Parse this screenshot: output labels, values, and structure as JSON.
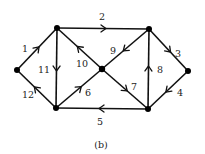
{
  "caption": "(b)",
  "colors": {
    "stroke": "#111111",
    "node": "#000000",
    "text": "#222222",
    "background": "#ffffff"
  },
  "nodes": [
    {
      "id": "L",
      "x": 17,
      "y": 70
    },
    {
      "id": "TL",
      "x": 57,
      "y": 28
    },
    {
      "id": "TR",
      "x": 149,
      "y": 29
    },
    {
      "id": "R",
      "x": 188,
      "y": 71
    },
    {
      "id": "BR",
      "x": 148,
      "y": 109
    },
    {
      "id": "BL",
      "x": 56,
      "y": 108
    },
    {
      "id": "C",
      "x": 102,
      "y": 69
    }
  ],
  "edges": [
    {
      "label": "1",
      "from": "L",
      "to": "TL",
      "label_x": 25,
      "label_y": 52
    },
    {
      "label": "2",
      "from": "TL",
      "to": "TR",
      "label_x": 102,
      "label_y": 20
    },
    {
      "label": "3",
      "from": "TR",
      "to": "R",
      "label_x": 178,
      "label_y": 57
    },
    {
      "label": "4",
      "from": "R",
      "to": "BR",
      "label_x": 180,
      "label_y": 96
    },
    {
      "label": "5",
      "from": "BR",
      "to": "BL",
      "label_x": 100,
      "label_y": 125
    },
    {
      "label": "6",
      "from": "BL",
      "to": "C",
      "label_x": 88,
      "label_y": 96
    },
    {
      "label": "7",
      "from": "C",
      "to": "BR",
      "label_x": 134,
      "label_y": 90
    },
    {
      "label": "8",
      "from": "BR",
      "to": "TR",
      "label_x": 160,
      "label_y": 73
    },
    {
      "label": "9",
      "from": "TR",
      "to": "C",
      "label_x": 113,
      "label_y": 54
    },
    {
      "label": "10",
      "from": "C",
      "to": "TL",
      "label_x": 82,
      "label_y": 67
    },
    {
      "label": "11",
      "from": "TL",
      "to": "BL",
      "label_x": 44,
      "label_y": 73
    },
    {
      "label": "12",
      "from": "BL",
      "to": "L",
      "label_x": 28,
      "label_y": 98
    }
  ]
}
